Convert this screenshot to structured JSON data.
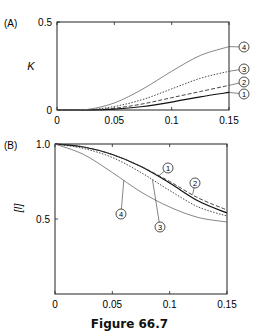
{
  "caption": "Figure 66.7",
  "chart_data": [
    {
      "type": "line",
      "panel_label": "(A)",
      "title": "",
      "xlabel": "",
      "ylabel": "K",
      "xlim": [
        0,
        0.15
      ],
      "ylim": [
        0,
        0.5
      ],
      "xticks": [
        "0",
        "0.05",
        "0.1",
        "0.15"
      ],
      "yticks": [
        "0",
        "0.5"
      ],
      "grid": false,
      "x": [
        0,
        0.025,
        0.05,
        0.075,
        0.1,
        0.125,
        0.15
      ],
      "series": [
        {
          "name": "1",
          "style": "solid",
          "values": [
            0,
            0,
            0.005,
            0.02,
            0.045,
            0.075,
            0.1
          ]
        },
        {
          "name": "2",
          "style": "dashed",
          "values": [
            0,
            0,
            0.01,
            0.035,
            0.07,
            0.105,
            0.14
          ]
        },
        {
          "name": "3",
          "style": "dotted",
          "values": [
            0,
            0,
            0.02,
            0.06,
            0.12,
            0.18,
            0.22
          ]
        },
        {
          "name": "4",
          "style": "thin",
          "values": [
            0,
            0.002,
            0.04,
            0.12,
            0.22,
            0.31,
            0.36
          ]
        }
      ]
    },
    {
      "type": "line",
      "panel_label": "(B)",
      "title": "",
      "xlabel": "",
      "ylabel": "[I]",
      "xlim": [
        0,
        0.15
      ],
      "ylim": [
        0,
        1.0
      ],
      "xticks": [
        "0",
        "0.05",
        "0.1",
        "0.15"
      ],
      "yticks": [
        "0.5",
        "1.0"
      ],
      "grid": false,
      "x": [
        0,
        0.025,
        0.05,
        0.075,
        0.1,
        0.125,
        0.15
      ],
      "series": [
        {
          "name": "1",
          "style": "solid",
          "values": [
            1.0,
            0.98,
            0.93,
            0.85,
            0.74,
            0.62,
            0.54
          ]
        },
        {
          "name": "2",
          "style": "dashed",
          "values": [
            1.0,
            0.98,
            0.93,
            0.85,
            0.75,
            0.64,
            0.56
          ]
        },
        {
          "name": "3",
          "style": "dotted",
          "values": [
            1.0,
            0.97,
            0.91,
            0.81,
            0.69,
            0.58,
            0.52
          ]
        },
        {
          "name": "4",
          "style": "thin",
          "values": [
            1.0,
            0.93,
            0.81,
            0.68,
            0.58,
            0.51,
            0.48
          ]
        }
      ]
    }
  ]
}
